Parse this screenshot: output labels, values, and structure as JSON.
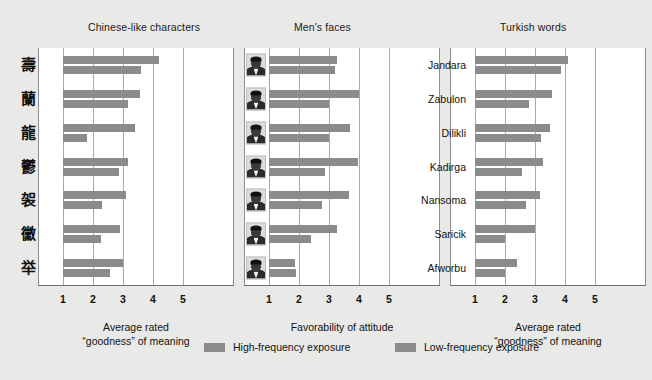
{
  "figure": {
    "background_color": "#e9e9e7",
    "plot_background_color": "#ffffff",
    "bar_color": "#8b8b8b",
    "grid_color": "#a9a9a9"
  },
  "legend": {
    "position": "bottom-center",
    "entries": [
      {
        "label": "High-frequency exposure",
        "color": "#8b8b8b"
      },
      {
        "label": "Low-frequency exposure",
        "color": "#8b8b8b"
      }
    ]
  },
  "axis": {
    "ticks": [
      "1",
      "2",
      "3",
      "4",
      "5"
    ],
    "xlim": [
      1,
      5
    ]
  },
  "chart_data": [
    {
      "type": "bar",
      "title": "Chinese-like characters",
      "xlabel": "Average rated\n\"goodness\" of meaning",
      "xlabel_line1": "Average rated",
      "xlabel_line2": "“goodness” of meaning",
      "ylabel": "",
      "orientation": "horizontal",
      "xlim": [
        1,
        5
      ],
      "ticks": [
        1,
        2,
        3,
        4,
        5
      ],
      "grid": true,
      "categories": [
        "char-1",
        "char-2",
        "char-3",
        "char-4",
        "char-5",
        "char-6",
        "char-7"
      ],
      "category_glyphs": [
        "壽",
        "蘭",
        "龍",
        "鬱",
        "袈",
        "黴",
        "举"
      ],
      "series": [
        {
          "name": "High-frequency exposure",
          "values": [
            4.2,
            3.55,
            3.4,
            3.15,
            3.1,
            2.9,
            3.0
          ]
        },
        {
          "name": "Low-frequency exposure",
          "values": [
            3.6,
            3.15,
            1.8,
            2.85,
            2.3,
            2.25,
            2.55
          ]
        }
      ]
    },
    {
      "type": "bar",
      "title": "Men's faces",
      "xlabel_line1": "Favorability of attitude",
      "xlabel_line2": "",
      "ylabel": "",
      "orientation": "horizontal",
      "xlim": [
        1,
        5
      ],
      "ticks": [
        1,
        2,
        3,
        4,
        5
      ],
      "grid": true,
      "categories": [
        "face-1",
        "face-2",
        "face-3",
        "face-4",
        "face-5",
        "face-6",
        "face-7"
      ],
      "series": [
        {
          "name": "High-frequency exposure",
          "values": [
            3.25,
            4.0,
            3.7,
            3.95,
            3.65,
            3.25,
            1.85
          ]
        },
        {
          "name": "Low-frequency exposure",
          "values": [
            3.2,
            3.0,
            3.0,
            2.85,
            2.75,
            2.4,
            1.9
          ]
        }
      ]
    },
    {
      "type": "bar",
      "title": "Turkish words",
      "xlabel_line1": "Average rated",
      "xlabel_line2": "“goodness” of meaning",
      "ylabel": "",
      "orientation": "horizontal",
      "xlim": [
        1,
        5
      ],
      "ticks": [
        1,
        2,
        3,
        4,
        5
      ],
      "grid": true,
      "categories": [
        "Jandara",
        "Zabulon",
        "Dilikli",
        "Kadirga",
        "Nansoma",
        "Saricik",
        "Afworbu"
      ],
      "series": [
        {
          "name": "High-frequency exposure",
          "values": [
            4.1,
            3.55,
            3.5,
            3.25,
            3.15,
            3.0,
            2.4
          ]
        },
        {
          "name": "Low-frequency exposure",
          "values": [
            3.85,
            2.8,
            3.2,
            2.55,
            2.7,
            2.0,
            2.0
          ]
        }
      ]
    }
  ]
}
